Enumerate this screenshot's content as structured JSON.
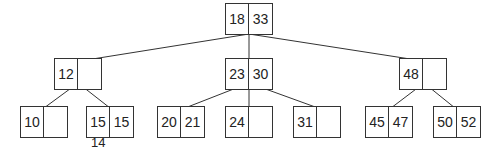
{
  "diagram": {
    "type": "2-3 tree",
    "root": {
      "keys": [
        "18",
        "33"
      ]
    },
    "level1": [
      {
        "keys": [
          "12",
          ""
        ]
      },
      {
        "keys": [
          "23",
          "30"
        ]
      },
      {
        "keys": [
          "48",
          ""
        ]
      }
    ],
    "leaves": [
      {
        "keys": [
          "10",
          ""
        ]
      },
      {
        "keys": [
          "15",
          "15"
        ],
        "struck_key": "15"
      },
      {
        "keys": [
          "20",
          "21"
        ]
      },
      {
        "keys": [
          "24",
          ""
        ]
      },
      {
        "keys": [
          "31",
          ""
        ]
      },
      {
        "keys": [
          "45",
          "47"
        ]
      },
      {
        "keys": [
          "50",
          "52"
        ]
      }
    ],
    "annotation": "14"
  }
}
